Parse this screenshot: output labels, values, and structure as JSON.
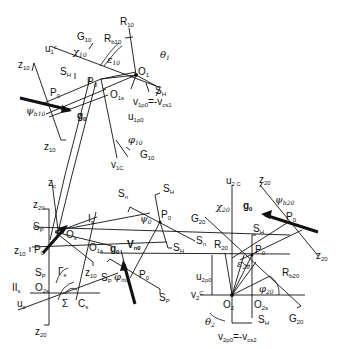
{
  "diagram": {
    "upper_gear": {
      "labels": [
        "R10",
        "Rb10",
        "G10",
        "u1c",
        "χ10",
        "θ1",
        "ε10",
        "SH",
        "SH",
        "O1",
        "O1s",
        "P0",
        "P0",
        "z10",
        "z10",
        "ψb10",
        "g0",
        "v1p0=-vcs1",
        "u1p0",
        "φ10",
        "G10",
        "v1c"
      ]
    },
    "left_cross": {
      "labels": [
        "zc",
        "z20",
        "Sp",
        "Os",
        "z10",
        "P0",
        "Is",
        "O1s",
        "Sp",
        "Γs",
        "z10",
        "IIs",
        "O2s",
        "uc",
        "Σ",
        "Cs",
        "z20"
      ]
    },
    "center": {
      "labels": [
        "Sn",
        "SH",
        "P0",
        "ψ0",
        "Sn",
        "SH",
        "g0",
        "vn0",
        "Sp",
        "φn0",
        "P0",
        "Sp"
      ]
    },
    "lower_gear": {
      "labels": [
        "u2c",
        "z20",
        "χ20",
        "G20",
        "g0",
        "ψb20",
        "P0",
        "SH",
        "R20",
        "P0",
        "z20",
        "ε20",
        "u2p0",
        "Rb20",
        "v2c",
        "φ20",
        "O2",
        "O2s",
        "θ2",
        "SH",
        "G20",
        "v2p0=-vcs2"
      ]
    }
  }
}
